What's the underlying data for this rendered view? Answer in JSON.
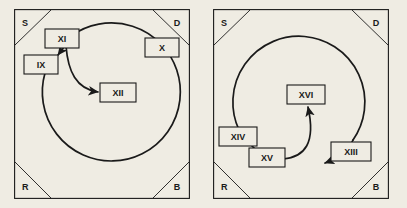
{
  "figure": {
    "background_color": "#efece3",
    "line_color": "#1a1a1a",
    "panel_count": 2
  },
  "panels": [
    {
      "id": "left",
      "corners": [
        {
          "name": "top-left",
          "label": "S"
        },
        {
          "name": "top-right",
          "label": "D"
        },
        {
          "name": "bottom-left",
          "label": "R"
        },
        {
          "name": "bottom-right",
          "label": "B"
        }
      ],
      "nodes": [
        {
          "id": "xi",
          "label": "XI",
          "x": 48,
          "y": 30
        },
        {
          "id": "ix",
          "label": "IX",
          "x": 27,
          "y": 55
        },
        {
          "id": "x",
          "label": "X",
          "x": 148,
          "y": 38
        },
        {
          "id": "xii",
          "label": "XII",
          "x": 104,
          "y": 83
        }
      ],
      "arrows": [
        {
          "from": "xi",
          "to": "ix",
          "style": "short-arrow"
        },
        {
          "from": "xi",
          "to": "xii",
          "style": "curved-arrow"
        }
      ]
    },
    {
      "id": "right",
      "corners": [
        {
          "name": "top-left",
          "label": "S"
        },
        {
          "name": "top-right",
          "label": "D"
        },
        {
          "name": "bottom-left",
          "label": "R"
        },
        {
          "name": "bottom-right",
          "label": "B"
        }
      ],
      "nodes": [
        {
          "id": "xvi",
          "label": "XVI",
          "x": 93,
          "y": 85
        },
        {
          "id": "xiv",
          "label": "XIV",
          "x": 25,
          "y": 127
        },
        {
          "id": "xv",
          "label": "XV",
          "x": 54,
          "y": 148
        },
        {
          "id": "xiii",
          "label": "XIII",
          "x": 138,
          "y": 142
        }
      ],
      "arrows": [
        {
          "from": "xv",
          "to": "xvi",
          "style": "curved-arrow"
        },
        {
          "from": "arc",
          "to": "xiii",
          "style": "tangent-arrow"
        }
      ]
    }
  ]
}
